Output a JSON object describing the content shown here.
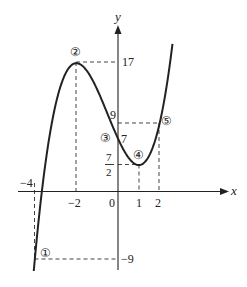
{
  "figure": {
    "function": "f(x) = x^3 + (3/2)x^2 - 6x + 7",
    "axes": {
      "x_label": "x",
      "y_label": "y",
      "origin_label": "0"
    },
    "x_ticks": [
      {
        "value": -4,
        "label": "−4"
      },
      {
        "value": -2,
        "label": "−2"
      },
      {
        "value": 1,
        "label": "1"
      },
      {
        "value": 2,
        "label": "2"
      }
    ],
    "y_ticks": [
      {
        "value": 17,
        "label": "17"
      },
      {
        "value": 9,
        "label": "9"
      },
      {
        "value": 7,
        "label": "7"
      },
      {
        "value": 3.5,
        "label_num": "7",
        "label_den": "2"
      },
      {
        "value": -9,
        "label": "−9"
      }
    ],
    "points": [
      {
        "marker": "①",
        "x": -4,
        "y": -9
      },
      {
        "marker": "②",
        "x": -2,
        "y": 17
      },
      {
        "marker": "③",
        "x": 0,
        "y": 7
      },
      {
        "marker": "④",
        "x": 1,
        "y": 3.5
      },
      {
        "marker": "⑤",
        "x": 2,
        "y": 9
      }
    ],
    "colors": {
      "curve": "#222222",
      "axis": "#222222",
      "guide": "#444444"
    }
  }
}
